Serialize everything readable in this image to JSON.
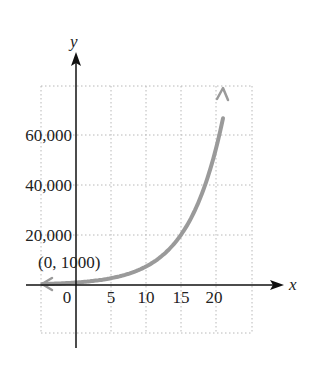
{
  "chart_data": {
    "type": "line",
    "title": "",
    "xlabel": "x",
    "ylabel": "y",
    "x_ticks": [
      "0",
      "5",
      "10",
      "15",
      "20"
    ],
    "y_ticks": [
      "20,000",
      "40,000",
      "60,000"
    ],
    "xlim": [
      -10,
      25
    ],
    "ylim": [
      -20000,
      80000
    ],
    "grid": true,
    "legend": null,
    "annotation": {
      "label": "(0, 1000)",
      "x": 0,
      "y": 1000
    },
    "series": [
      {
        "name": "exponential curve",
        "color": "#9a9a9a",
        "x": [
          -10,
          -5,
          0,
          5,
          10,
          15,
          18,
          20,
          21
        ],
        "y": [
          135,
          368,
          1000,
          2718,
          7389,
          20086,
          36598,
          54598,
          66686
        ]
      }
    ]
  },
  "colors": {
    "axis": "#111111",
    "grid": "#b8b8b8",
    "curve": "#9a9a9a",
    "text": "#222222"
  }
}
